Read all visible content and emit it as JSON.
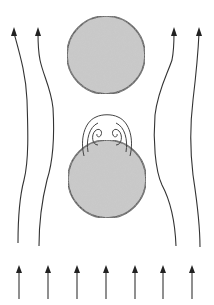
{
  "diagram": {
    "type": "flow-past-spheres",
    "flow_direction": "upward",
    "colors": {
      "background": "#ffffff",
      "line": "#333333",
      "sphere_fill": "#c4c4c4",
      "sphere_stroke": "#3a3a3a"
    },
    "spheres": [
      {
        "name": "upper-sphere",
        "cx": 106,
        "cy": 55,
        "r": 39
      },
      {
        "name": "lower-sphere",
        "cx": 107,
        "cy": 179,
        "r": 39
      }
    ],
    "inflow_arrows": {
      "count": 7,
      "x": [
        19,
        48,
        77,
        106,
        135,
        163,
        192
      ],
      "y_top": 266,
      "y_bottom": 299
    },
    "streamlines": {
      "count": 4,
      "arrow_tips_x": [
        14,
        38,
        174,
        199
      ],
      "arrow_tip_y": 29
    },
    "wake": {
      "description": "closed recirculation bubble with two counter-rotating vortices above the lower sphere",
      "vortex_count": 2
    }
  }
}
